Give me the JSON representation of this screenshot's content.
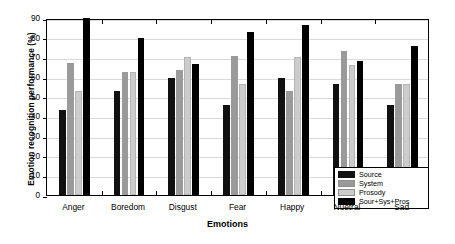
{
  "chart_data": {
    "type": "bar",
    "title": "",
    "xlabel": "Emotions",
    "ylabel": "Emotion recognition performance (%)",
    "ylim": [
      0,
      90
    ],
    "yticks": [
      0,
      10,
      20,
      30,
      40,
      50,
      60,
      70,
      80,
      90
    ],
    "grid": true,
    "legend_position": "lower right",
    "categories": [
      "Anger",
      "Boredom",
      "Disgust",
      "Fear",
      "Happy",
      "Nuetral",
      "Sad"
    ],
    "series": [
      {
        "name": "Source",
        "color": "#111111",
        "values": [
          43.0,
          53.0,
          59.5,
          46.0,
          59.5,
          56.5,
          46.0
        ]
      },
      {
        "name": "System",
        "color": "#9a9a9a",
        "values": [
          67.0,
          62.5,
          63.5,
          70.5,
          53.0,
          73.0,
          56.5
        ]
      },
      {
        "name": "Prosody",
        "color": "#cccccc",
        "values": [
          53.0,
          62.5,
          70.0,
          56.5,
          70.0,
          66.0,
          56.5
        ]
      },
      {
        "name": "Sour+Sys+Pros",
        "color": "#000000",
        "values": [
          90.0,
          80.0,
          66.5,
          83.0,
          86.5,
          68.0,
          76.0
        ]
      }
    ]
  }
}
